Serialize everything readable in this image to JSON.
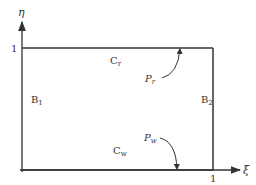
{
  "diagram": {
    "type": "computational-domain",
    "axes": {
      "x_label": "ξ",
      "y_label": "η",
      "x_tick": "1",
      "y_tick": "1"
    },
    "boundaries": {
      "top": {
        "label": "C",
        "sub": "r"
      },
      "bottom": {
        "label": "C",
        "sub": "w"
      },
      "left": {
        "label": "B",
        "sub": "1"
      },
      "right": {
        "label": "B",
        "sub": "2"
      }
    },
    "points": {
      "top": {
        "label": "P",
        "sub": "r"
      },
      "bottom": {
        "label": "P",
        "sub": "w"
      }
    },
    "colors": {
      "line": "#333333",
      "background": "#ffffff"
    }
  }
}
